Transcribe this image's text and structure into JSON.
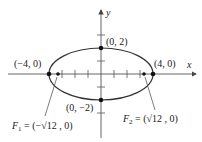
{
  "diagram": {
    "type": "ellipse-on-axes",
    "axes": {
      "x_label": "x",
      "y_label": "y"
    },
    "ellipse": {
      "center": [
        0,
        0
      ],
      "a": 4,
      "b": 2
    },
    "points": {
      "top": "(0, 2)",
      "bottom": "(0, −2)",
      "left": "(−4, 0)",
      "right": "(4, 0)"
    },
    "foci": {
      "f1": {
        "name": "F",
        "sub": "1",
        "value": " = (−√12 , 0)"
      },
      "f2": {
        "name": "F",
        "sub": "2",
        "value": " = (√12 , 0)"
      }
    },
    "colors": {
      "curve": "#333333",
      "axis": "#555555",
      "text": "#222222"
    }
  }
}
